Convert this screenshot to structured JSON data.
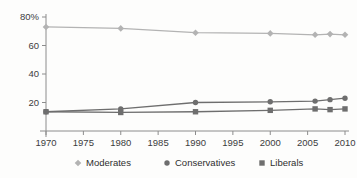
{
  "chart_data": {
    "type": "line",
    "title": "",
    "subtitle": "",
    "xlabel": "",
    "ylabel": "",
    "x": [
      1970,
      1980,
      1990,
      2000,
      2006,
      2008,
      2010
    ],
    "xlim": [
      1970,
      2010
    ],
    "ylim": [
      0,
      80
    ],
    "grid": false,
    "legend_position": "bottom",
    "x_ticks": [
      "1970",
      "1975",
      "1980",
      "1985",
      "1990",
      "1995",
      "2000",
      "2005",
      "2010"
    ],
    "x_tick_values": [
      1970,
      1975,
      1980,
      1985,
      1990,
      1995,
      2000,
      2005,
      2010
    ],
    "y_ticks": [
      "20",
      "40",
      "60",
      "80%"
    ],
    "y_tick_values": [
      20,
      40,
      60,
      80
    ],
    "series": [
      {
        "name": "Moderates",
        "marker": "diamond",
        "color": "#b3b3b3",
        "values": [
          73,
          72,
          69,
          68.5,
          67.5,
          68,
          67.5
        ]
      },
      {
        "name": "Conservatives",
        "marker": "circle",
        "color": "#6e6e6e",
        "values": [
          13.5,
          15.5,
          20,
          20.5,
          21,
          22,
          23
        ]
      },
      {
        "name": "Liberals",
        "marker": "square",
        "color": "#6e6e6e",
        "values": [
          13.5,
          13,
          13.5,
          14.5,
          15.5,
          15,
          15.5
        ]
      }
    ]
  },
  "legend": {
    "items": [
      {
        "label": "Moderates",
        "marker": "diamond",
        "color": "#b3b3b3"
      },
      {
        "label": "Conservatives",
        "marker": "circle",
        "color": "#6e6e6e"
      },
      {
        "label": "Liberals",
        "marker": "square",
        "color": "#6e6e6e"
      }
    ]
  },
  "axes": {
    "y_axis_label": "",
    "x_axis_label": ""
  }
}
